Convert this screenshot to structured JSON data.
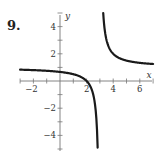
{
  "problem_number": "9.",
  "chart_data": {
    "type": "line",
    "title": "",
    "xlabel": "x",
    "ylabel": "y",
    "xlim": [
      -3,
      7
    ],
    "ylim": [
      -5,
      5
    ],
    "x_ticks": [
      -2,
      2,
      4,
      6
    ],
    "x_tick_labels": [
      "-2",
      "2",
      "4",
      "6"
    ],
    "y_ticks": [
      -4,
      -2,
      2,
      4
    ],
    "y_tick_labels": [
      "-4",
      "-2",
      "2",
      "4"
    ],
    "grid": false,
    "function": "y = (x - 2) / (x - 3)",
    "vertical_asymptote": 3,
    "horizontal_asymptote": 1,
    "x_intercept": 2,
    "y_intercept": 0.67,
    "series": [
      {
        "name": "left-branch",
        "x": [
          -3,
          -2,
          -1,
          0,
          1,
          2,
          2.5,
          2.75,
          2.8
        ],
        "y": [
          0.83,
          0.8,
          0.75,
          0.67,
          0.5,
          0,
          -1,
          -3,
          -4
        ]
      },
      {
        "name": "right-branch",
        "x": [
          3.2,
          3.25,
          3.5,
          4,
          5,
          6,
          7
        ],
        "y": [
          6,
          5,
          3,
          2,
          1.5,
          1.33,
          1.25
        ]
      }
    ]
  }
}
